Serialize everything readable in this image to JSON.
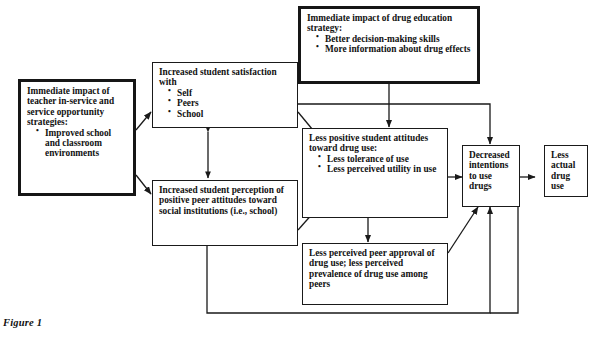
{
  "figure": {
    "caption": "Figure 1"
  },
  "colors": {
    "line": "#1a1a1a",
    "heavy_border": "#161616",
    "background": "#ffffff",
    "text": "#111111"
  },
  "diagram": {
    "type": "flowchart",
    "nodes": [
      {
        "id": "teacher-strategies",
        "emphasis": "heavy",
        "title": "Immediate impact of teacher in-service and service opportunity strategies:",
        "bullets": [
          "Improved school and classroom environments"
        ]
      },
      {
        "id": "drug-education-strategy",
        "emphasis": "heavy",
        "title": "Immediate impact of drug education strategy:",
        "bullets": [
          "Better decision-making skills",
          "More information about drug effects"
        ]
      },
      {
        "id": "student-satisfaction",
        "emphasis": "normal",
        "title": "Increased student satisfaction with",
        "bullets": [
          "Self",
          "Peers",
          "School"
        ]
      },
      {
        "id": "peer-perception",
        "emphasis": "normal",
        "title": "Increased student perception of positive peer attitudes toward social institutions (i.e., school)",
        "bullets": []
      },
      {
        "id": "less-positive-attitudes",
        "emphasis": "normal",
        "title": "Less positive student attitudes toward drug use:",
        "bullets": [
          "Less tolerance of use",
          "Less perceived utility in use"
        ]
      },
      {
        "id": "less-peer-approval",
        "emphasis": "normal",
        "title": "Less perceived peer approval of drug use; less perceived prevalence of drug use among peers",
        "bullets": []
      },
      {
        "id": "decreased-intentions",
        "emphasis": "normal",
        "title": "Decreased intentions to use drugs",
        "bullets": []
      },
      {
        "id": "less-actual-use",
        "emphasis": "normal",
        "title": "Less actual drug use",
        "bullets": []
      }
    ],
    "edges": [
      {
        "from": "teacher-strategies",
        "to": "student-satisfaction",
        "style": "arrow"
      },
      {
        "from": "teacher-strategies",
        "to": "peer-perception",
        "style": "arrow"
      },
      {
        "from": "student-satisfaction",
        "to": "peer-perception",
        "style": "double-arrow"
      },
      {
        "from": "student-satisfaction",
        "to": "less-positive-attitudes",
        "style": "arrow"
      },
      {
        "from": "student-satisfaction",
        "to": "decreased-intentions",
        "style": "arrow"
      },
      {
        "from": "drug-education-strategy",
        "to": "less-positive-attitudes",
        "style": "arrow"
      },
      {
        "from": "peer-perception",
        "to": "less-positive-attitudes",
        "style": "arrow"
      },
      {
        "from": "peer-perception",
        "to": "less-peer-approval",
        "style": "arrow"
      },
      {
        "from": "peer-perception",
        "to": "decreased-intentions",
        "style": "arrow-feedback"
      },
      {
        "from": "less-positive-attitudes",
        "to": "decreased-intentions",
        "style": "arrow"
      },
      {
        "from": "less-peer-approval",
        "to": "decreased-intentions",
        "style": "arrow"
      },
      {
        "from": "decreased-intentions",
        "to": "less-actual-use",
        "style": "arrow"
      },
      {
        "from": "less-actual-use",
        "to": "decreased-intentions",
        "style": "arrow-feedback"
      }
    ]
  }
}
